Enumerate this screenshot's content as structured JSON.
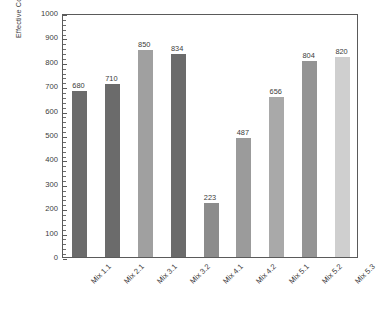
{
  "chart_data": {
    "type": "bar",
    "title": "",
    "xlabel": "",
    "ylabel": "Effective Cohesion c', (kPa)",
    "ylim": [
      0,
      1000
    ],
    "ytick_step": 100,
    "yminor_step": 20,
    "grid": false,
    "legend": "none",
    "categories": [
      "Mix 1.1",
      "Mix 2.1",
      "Mix 3.1",
      "Mix 3.2",
      "Mix 4.1",
      "Mix 4.2",
      "Mix 5.1",
      "Mix 5.2",
      "Mix 5.3"
    ],
    "values": [
      680,
      710,
      850,
      834,
      223,
      487,
      656,
      804,
      820
    ],
    "value_labels": [
      "680",
      "710",
      "850",
      "834",
      "223",
      "487",
      "656",
      "804",
      "820"
    ],
    "bar_colors": [
      "#6b6b6b",
      "#6b6b6b",
      "#a0a0a0",
      "#6b6b6b",
      "#8c8c8c",
      "#9b9b9b",
      "#a9a9a9",
      "#949494",
      "#cfcfcf"
    ],
    "ytick_labels": [
      "0",
      "100",
      "200",
      "300",
      "400",
      "500",
      "600",
      "700",
      "800",
      "900",
      "1000"
    ],
    "axis_color": "#5a5a5a",
    "text_color": "#3b3b3b",
    "background": "#ffffff"
  }
}
